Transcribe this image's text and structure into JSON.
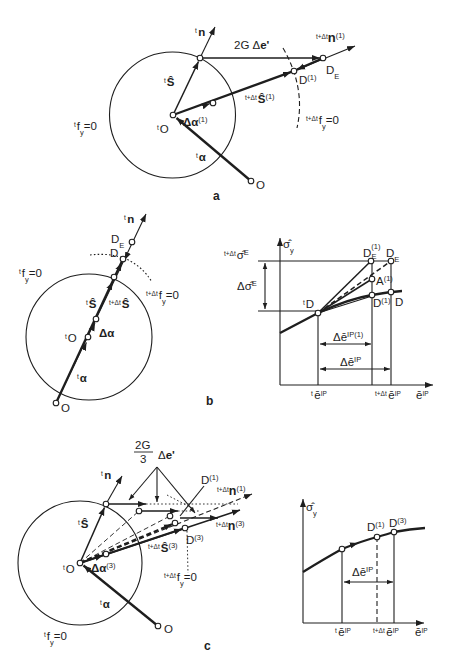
{
  "figure": {
    "panel_a": {
      "caption": "a",
      "tn": {
        "pre": "t",
        "main": "n"
      },
      "two_g_de": {
        "coef": "2G Δ",
        "main": "e'"
      },
      "n1": {
        "pre": "t+Δt",
        "main": "n",
        "sup": "(1)"
      },
      "de": {
        "main": "D",
        "sub": "E"
      },
      "d1": {
        "main": "D",
        "sup": "(1)"
      },
      "ts": {
        "pre": "t",
        "main": "Ŝ"
      },
      "s1": {
        "pre": "t+Δt",
        "main": "Ŝ",
        "sup": "(1)"
      },
      "tfy": {
        "pre": "t",
        "main": "f",
        "sub": "y",
        "post": "=0"
      },
      "fy": {
        "pre": "t+Δt",
        "main": "f",
        "sub": "y",
        "post": "=0"
      },
      "to": {
        "pre": "t",
        "main": "O"
      },
      "dalpha": {
        "main": "Δα",
        "sup": "(1)"
      },
      "talpha": {
        "pre": "t",
        "main": "α"
      },
      "o": "O"
    },
    "panel_b": {
      "caption": "b",
      "tn": {
        "pre": "t",
        "main": "n"
      },
      "de": {
        "main": "D",
        "sub": "E"
      },
      "d": "D",
      "tfy": {
        "pre": "t",
        "main": "f",
        "sub": "y",
        "post": "=0"
      },
      "fy": {
        "pre": "t+Δt",
        "main": "f",
        "sub": "y",
        "post": "=0"
      },
      "ts": {
        "pre": "t",
        "main": "Ŝ"
      },
      "s": {
        "pre": "t+Δt",
        "main": "Ŝ"
      },
      "to": {
        "pre": "t",
        "main": "O"
      },
      "dalpha": "Δα",
      "talpha": {
        "pre": "t",
        "main": "α"
      },
      "o": "O"
    },
    "chart_b": {
      "ylabel": {
        "main": "σ̂",
        "sub": "y"
      },
      "sigma_e": {
        "pre": "t+Δt",
        "main": "σ̂",
        "sup": "E"
      },
      "dsigma_e": {
        "main": "Δσ̂",
        "sup": "E"
      },
      "td": {
        "pre": "t",
        "main": "D"
      },
      "de1": {
        "main": "D",
        "sup": "(1)",
        "sub": "E"
      },
      "de": {
        "main": "D",
        "sub": "E"
      },
      "a1": {
        "main": "A",
        "sup": "(1)"
      },
      "d1": {
        "main": "D",
        "sup": "(1)"
      },
      "d": "D",
      "de1_interval": {
        "main": "Δē",
        "sup": "IP(1)"
      },
      "de_interval": {
        "main": "Δē",
        "sup": "IP"
      },
      "x_t": {
        "pre": "t",
        "main": "ē",
        "sup": "IP"
      },
      "x_tdt": {
        "pre": "t+Δt",
        "main": "ē",
        "sup": "IP"
      },
      "xlabel": {
        "main": "ē",
        "sup": "IP"
      }
    },
    "panel_c": {
      "caption": "c",
      "fraction": {
        "num": "2G",
        "den": "3",
        "main": "e'",
        "coef": "Δ"
      },
      "tn": {
        "pre": "t",
        "main": "n"
      },
      "d1": {
        "main": "D",
        "sup": "(1)"
      },
      "n1": {
        "pre": "t+Δt",
        "main": "n",
        "sup": "(1)"
      },
      "n3": {
        "pre": "t+Δt",
        "main": "n",
        "sup": "(3)"
      },
      "d3": {
        "main": "D",
        "sup": "(3)"
      },
      "s3": {
        "pre": "t+Δt",
        "main": "Ŝ",
        "sup": "(3)"
      },
      "fy": {
        "pre": "t+Δt",
        "main": "f",
        "sub": "y",
        "post": "=0"
      },
      "ts": {
        "pre": "t",
        "main": "Ŝ"
      },
      "to": {
        "pre": "t",
        "main": "O"
      },
      "dalpha": {
        "main": "Δα",
        "sup": "(3)"
      },
      "talpha": {
        "pre": "t",
        "main": "α"
      },
      "o": "O",
      "tfy": {
        "pre": "t",
        "main": "f",
        "sub": "y",
        "post": "=0"
      }
    },
    "chart_c": {
      "ylabel": {
        "main": "σ̂",
        "sub": "y"
      },
      "d1": {
        "main": "D",
        "sup": "(1)"
      },
      "d3": {
        "main": "D",
        "sup": "(3)"
      },
      "de_interval": {
        "main": "Δē",
        "sup": "IP"
      },
      "x_t": {
        "pre": "t",
        "main": "ē",
        "sup": "IP"
      },
      "x_tdt": {
        "pre": "t+Δt",
        "main": "ē",
        "sup": "IP"
      },
      "xlabel": {
        "main": "ē",
        "sup": "IP"
      }
    }
  }
}
